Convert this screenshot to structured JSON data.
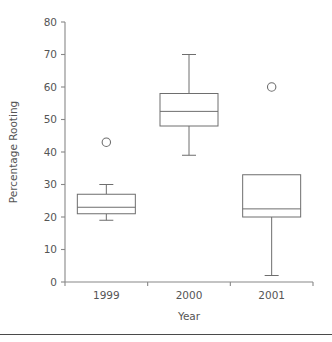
{
  "chart_data": {
    "type": "box",
    "title": "",
    "xlabel": "Year",
    "ylabel": "Percentage Rooting",
    "categories": [
      "1999",
      "2000",
      "2001"
    ],
    "ylim": [
      0,
      80
    ],
    "yticks": [
      0,
      10,
      20,
      30,
      40,
      50,
      60,
      70,
      80
    ],
    "ytick_labels": [
      "0",
      "10",
      "20",
      "30",
      "40",
      "50",
      "60",
      "70",
      "80"
    ],
    "grid": false,
    "legend": null,
    "boxes": [
      {
        "category": "1999",
        "whisker_low": 19,
        "q1": 21,
        "median": 23,
        "q3": 27,
        "whisker_high": 30,
        "outliers": [
          43
        ]
      },
      {
        "category": "2000",
        "whisker_low": 39,
        "q1": 48,
        "median": 52.5,
        "q3": 58,
        "whisker_high": 70,
        "outliers": []
      },
      {
        "category": "2001",
        "whisker_low": 2,
        "q1": 20,
        "median": 22.5,
        "q3": 33,
        "whisker_high": 33,
        "outliers": [
          60
        ]
      }
    ],
    "colors": {
      "box_stroke": "#6e6e6e",
      "box_fill": "#ffffff",
      "axis": "#888888",
      "text": "#555555",
      "background": "#ffffff"
    }
  },
  "axis": {
    "y_label": "Percentage Rooting",
    "x_label": "Year",
    "y_ticks": [
      "80",
      "70",
      "60",
      "50",
      "40",
      "30",
      "20",
      "10",
      "0"
    ],
    "x_ticks": [
      "1999",
      "2000",
      "2001"
    ]
  }
}
